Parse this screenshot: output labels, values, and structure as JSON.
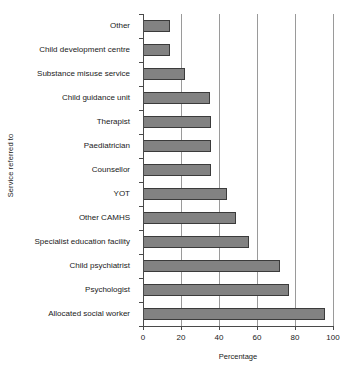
{
  "chart_data": {
    "type": "bar",
    "orientation": "horizontal",
    "title": "",
    "xlabel": "Percentage",
    "ylabel": "Service referred to",
    "xlim": [
      0,
      100
    ],
    "xticks": [
      0,
      20,
      40,
      60,
      80,
      100
    ],
    "xtick_labels": [
      "0",
      "20",
      "40",
      "60",
      "80",
      "100"
    ],
    "grid": "vertical",
    "legend": "none",
    "bar_color": "#828282",
    "bar_edge_color": "#3b3b3b",
    "categories": [
      "Other",
      "Child development centre",
      "Substance misuse service",
      "Child guidance unit",
      "Therapist",
      "Paediatrician",
      "Counsellor",
      "YOT",
      "Other CAMHS",
      "Specialist education facility",
      "Child psychiatrist",
      "Psychologist",
      "Allocated social worker"
    ],
    "values": [
      14,
      14,
      22,
      35,
      36,
      36,
      36,
      44,
      49,
      56,
      72,
      77,
      96
    ]
  }
}
